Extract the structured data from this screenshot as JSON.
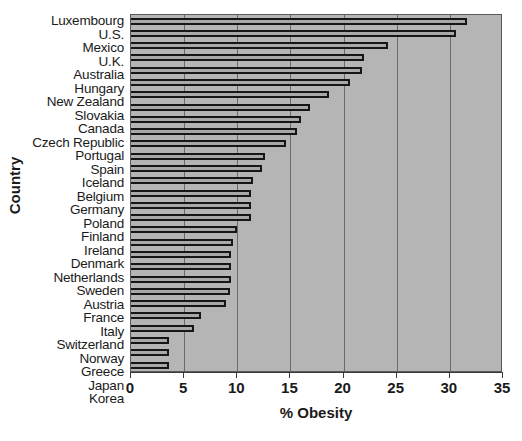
{
  "chart_data": {
    "type": "bar",
    "orientation": "horizontal",
    "title": "",
    "xlabel": "% Obesity",
    "ylabel": "Country",
    "xlim": [
      0,
      35
    ],
    "xticks": [
      0,
      5,
      10,
      15,
      20,
      25,
      30,
      35
    ],
    "xtick_labels": [
      "0",
      "5",
      "10",
      "15",
      "20",
      "25",
      "30",
      "35"
    ],
    "grid": true,
    "grid_axis": "x",
    "legend": false,
    "plot_background": "#b5b5b5",
    "bar_fill": "#a8a8a8",
    "bar_edge": "#161616",
    "categories": [
      "Luxembourg",
      "U.S.",
      "Mexico",
      "U.K.",
      "Australia",
      "Hungary",
      "New Zealand",
      "Slovakia",
      "Canada",
      "Czech Republic",
      "Portugal",
      "Spain",
      "Iceland",
      "Belgium",
      "Germany",
      "Poland",
      "Finland",
      "Ireland",
      "Denmark",
      "Netherlands",
      "Sweden",
      "Austria",
      "France",
      "Italy",
      "Switzerland",
      "Norway",
      "Greece",
      "Japan",
      "Korea"
    ],
    "values": [
      31.6,
      30.6,
      24.2,
      21.9,
      21.7,
      20.6,
      18.6,
      16.8,
      16.0,
      15.6,
      14.6,
      12.6,
      12.3,
      11.5,
      11.3,
      11.3,
      11.3,
      10.0,
      9.6,
      9.4,
      9.4,
      9.4,
      9.3,
      8.9,
      6.6,
      5.9,
      3.6,
      3.6,
      3.6
    ]
  }
}
